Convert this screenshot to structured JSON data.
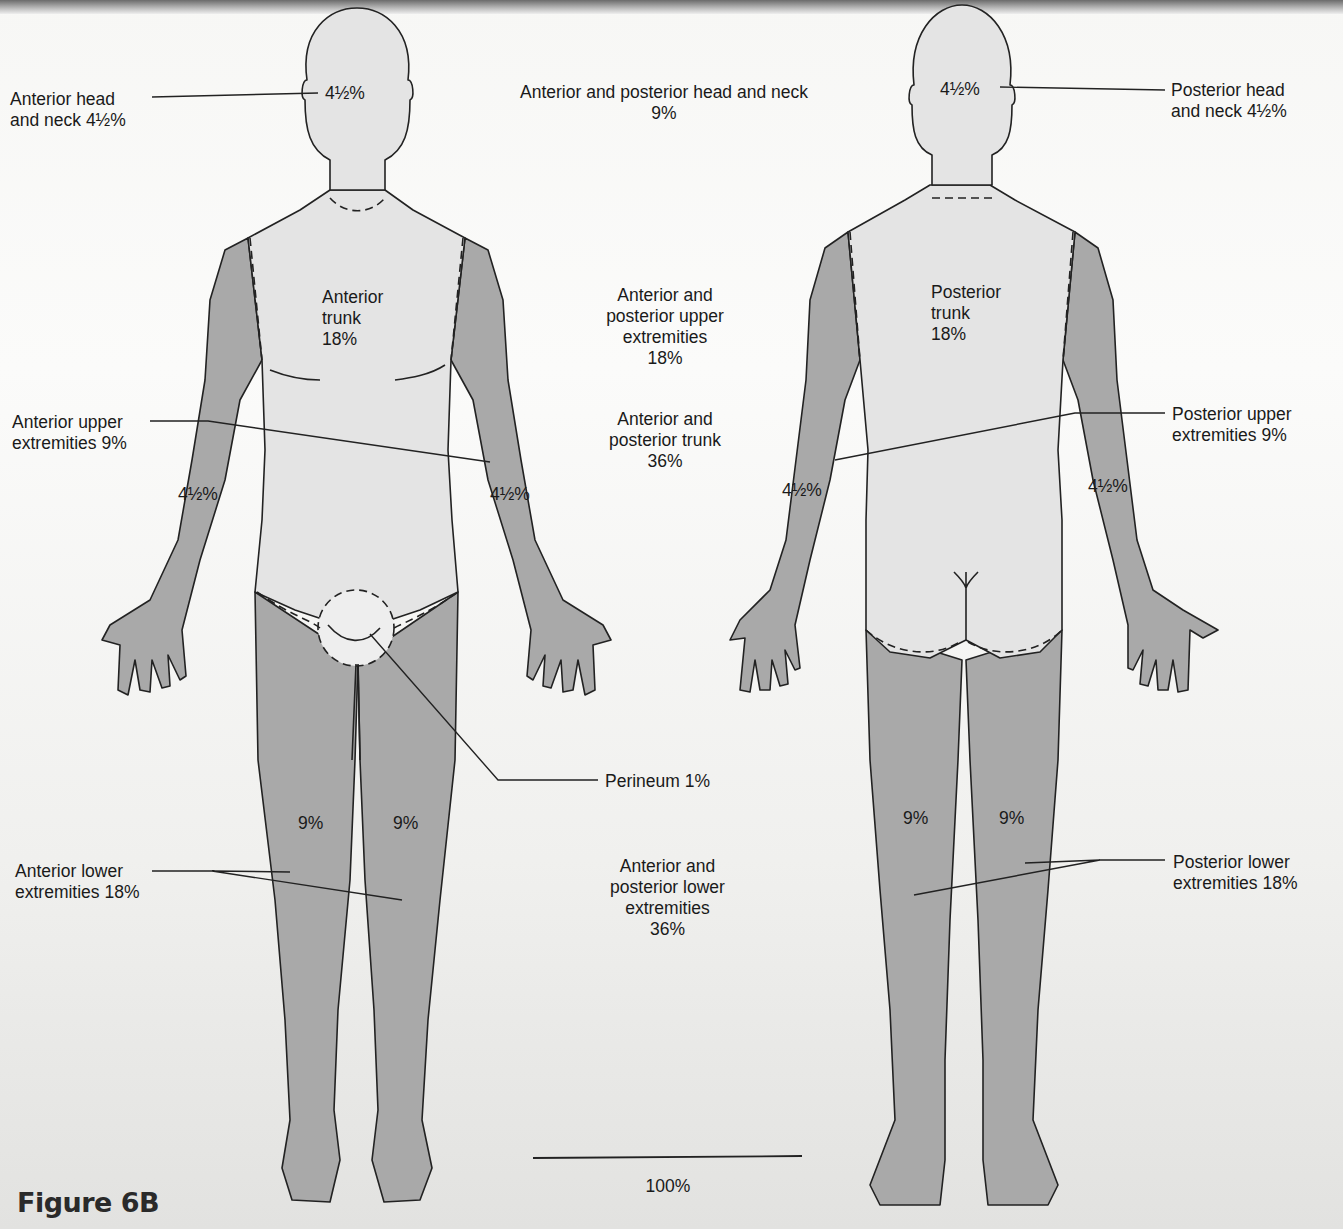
{
  "figure": {
    "title": "Figure 6B",
    "colors": {
      "light_region": "#e4e4e4",
      "dark_region": "#a9a9a9",
      "outline": "#222222",
      "background": "#f6f6f4"
    }
  },
  "anterior_figure": {
    "head_value": "4½%",
    "trunk_label": [
      "Anterior",
      "trunk",
      "18%"
    ],
    "left_arm_value": "4½%",
    "right_arm_value": "4½%",
    "left_leg_value": "9%",
    "right_leg_value": "9%"
  },
  "posterior_figure": {
    "head_value": "4½%",
    "trunk_label": [
      "Posterior",
      "trunk",
      "18%"
    ],
    "left_arm_value": "4½%",
    "right_arm_value": "4½%",
    "left_leg_value": "9%",
    "right_leg_value": "9%"
  },
  "callouts_left": {
    "anterior_head": [
      "Anterior head",
      "and neck 4½%"
    ],
    "anterior_upper": [
      "Anterior upper",
      "extremities 9%"
    ],
    "anterior_lower": [
      "Anterior lower",
      "extremities 18%"
    ]
  },
  "callouts_right": {
    "posterior_head": [
      "Posterior head",
      "and neck 4½%"
    ],
    "posterior_upper": [
      "Posterior upper",
      "extremities 9%"
    ],
    "posterior_lower": [
      "Posterior lower",
      "extremities 18%"
    ]
  },
  "center_summary": {
    "head_neck": [
      "Anterior and posterior head and neck",
      "9%"
    ],
    "upper_extremities": [
      "Anterior and",
      "posterior upper",
      "extremities",
      "18%"
    ],
    "trunk": [
      "Anterior and",
      "posterior trunk",
      "36%"
    ],
    "perineum": "Perineum 1%",
    "lower_extremities": [
      "Anterior and",
      "posterior lower",
      "extremities",
      "36%"
    ],
    "total": "100%"
  }
}
